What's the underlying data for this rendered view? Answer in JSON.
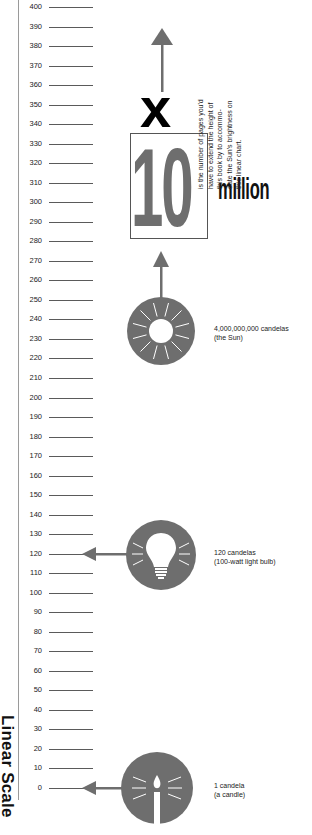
{
  "chart_data": {
    "type": "diagram",
    "title": "Linear Scale",
    "axis": {
      "label": "Linear Scale",
      "min": 0,
      "max": 400,
      "step": 10,
      "ticks": [
        400,
        390,
        380,
        370,
        360,
        350,
        340,
        330,
        320,
        310,
        300,
        290,
        280,
        270,
        260,
        250,
        240,
        230,
        220,
        210,
        200,
        190,
        180,
        170,
        160,
        150,
        140,
        130,
        120,
        110,
        100,
        90,
        80,
        70,
        60,
        50,
        40,
        30,
        20,
        10,
        0
      ]
    },
    "items": [
      {
        "name": "candle",
        "value": 1,
        "label_line1": "1 candela",
        "label_line2": "(a candle)"
      },
      {
        "name": "light-bulb",
        "value": 120,
        "label_line1": "120 candelas",
        "label_line2": "(100-watt light bulb)"
      },
      {
        "name": "sun",
        "value": 4000000000,
        "label_line1": "4,000,000,000 candelas",
        "label_line2": "(the Sun)"
      }
    ],
    "callout": {
      "multiplier": "x",
      "number": "10",
      "unit": "million",
      "text_lines": [
        "is the number of pages you'd",
        "have to extend the height of",
        "this book by to accommo-",
        "date the Sun's brightness on",
        "this linear chart."
      ]
    }
  },
  "colors": {
    "icon_gray": "#6e6e6e",
    "text": "#111111",
    "tick": "#5a5a5a"
  }
}
